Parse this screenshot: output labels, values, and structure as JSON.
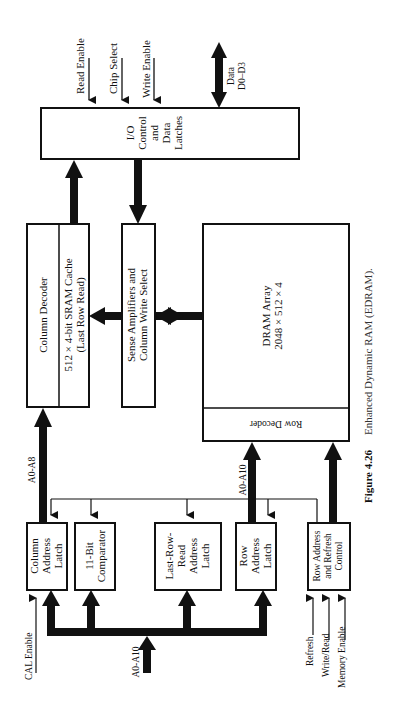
{
  "caption": {
    "figure_label": "Figure 4.26",
    "text": "Enhanced Dynamic RAM (EDRAM)."
  },
  "blocks": {
    "io": [
      "I/O",
      "Control",
      "and",
      "Data",
      "Latches"
    ],
    "column_decoder": "Column Decoder",
    "sram_cache": [
      "512 × 4-bit SRAM Cache",
      "(Last Row Read)"
    ],
    "sense_amps": [
      "Sense Amplifiers and",
      "Column Write Select"
    ],
    "dram_array": [
      "DRAM Array",
      "2048 × 512 × 4"
    ],
    "row_decoder": "Row Decoder",
    "column_address_latch": [
      "Column",
      "Address",
      "Latch"
    ],
    "comparator": [
      "11-Bit",
      "Comparator"
    ],
    "last_row_read_latch": [
      "Last-Row-",
      "Read",
      "Address",
      "Latch"
    ],
    "row_address_latch": [
      "Row",
      "Address",
      "Latch"
    ],
    "row_refresh_control": [
      "Row Address",
      "and Refresh",
      "Control"
    ]
  },
  "signals": {
    "read_enable": "Read Enable",
    "chip_select": "Chip Select",
    "write_enable": "Write Enable",
    "data": [
      "Data",
      "D0–D3"
    ],
    "a0_a8": "A0-A8",
    "a0_a10_row": "A0-A10",
    "a0_a10_input": "A0-A10",
    "cal_enable": "CAL Enable",
    "refresh": "Refresh",
    "write_read": "Write/Read",
    "memory_enable": "Memory Enable"
  }
}
